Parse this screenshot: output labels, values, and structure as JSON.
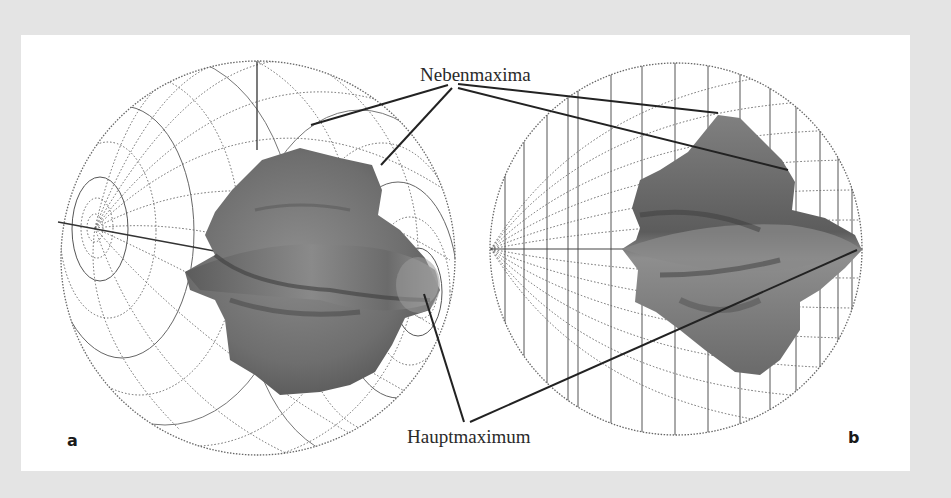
{
  "figure": {
    "callouts": {
      "top": "Nebenmaxima",
      "bottom": "Hauptmaximum"
    },
    "panels": [
      {
        "id": "a",
        "label": "a",
        "view": "oblique-wireframe-sphere-with-3d-pattern"
      },
      {
        "id": "b",
        "label": "b",
        "view": "side-wireframe-sphere-with-3d-pattern"
      }
    ],
    "colors": {
      "background": "#e4e4e4",
      "panel": "#ffffff",
      "wire": "#555555",
      "surface": "#7a7a7a",
      "leader": "#222222"
    }
  }
}
